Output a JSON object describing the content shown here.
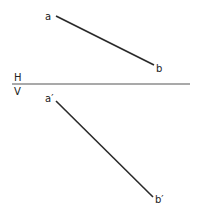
{
  "diagram": {
    "type": "orthographic-projection",
    "colors": {
      "line": "#2a2a2a",
      "background": "#ffffff"
    },
    "reference_line": {
      "upper_label": "H",
      "lower_label": "V",
      "x1": 12,
      "y1": 84,
      "x2": 190,
      "y2": 84
    },
    "top_view": {
      "start_label": "a",
      "end_label": "b",
      "x1": 56,
      "y1": 16,
      "x2": 154,
      "y2": 65
    },
    "front_view": {
      "start_label": "a′",
      "end_label": "b′",
      "x1": 56,
      "y1": 101,
      "x2": 153,
      "y2": 197
    }
  }
}
